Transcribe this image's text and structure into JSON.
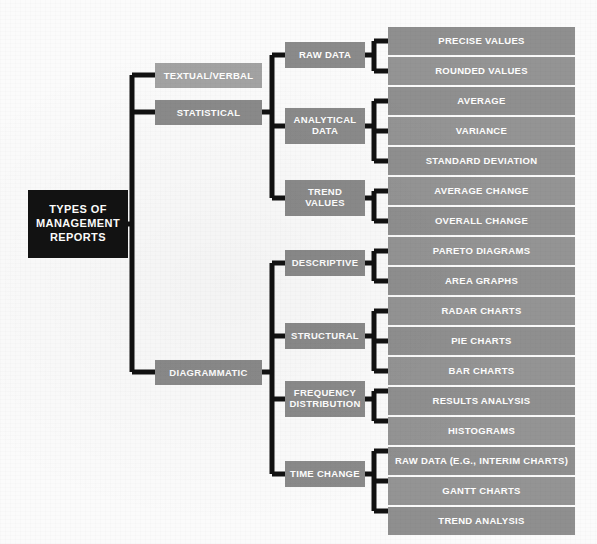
{
  "diagram": {
    "title": "Types of Management Reports",
    "root": {
      "label": "TYPES OF\nMANAGEMENT\nREPORTS",
      "line1": "TYPES OF",
      "line2": "MANAGEMENT",
      "line3": "REPORTS",
      "color": "#121212"
    },
    "colors": {
      "root_bg": "#121212",
      "level2_light_bg": "#a3a3a3",
      "level2_dark_bg": "#8a8a8a",
      "level3_bg": "#8a8a8a",
      "leaf_bg": "#8f8f8f",
      "connector": "#111111",
      "text": "#ffffff",
      "background": "#fbfbfb"
    },
    "level2": [
      {
        "label": "TEXTUAL/VERBAL",
        "shade": "light"
      },
      {
        "label": "STATISTICAL",
        "shade": "dark"
      },
      {
        "label": "DIAGRAMMATIC",
        "shade": "dark"
      }
    ],
    "level3": [
      {
        "line1": "RAW DATA",
        "line2": "",
        "parent": "STATISTICAL"
      },
      {
        "line1": "ANALYTICAL",
        "line2": "DATA",
        "parent": "STATISTICAL"
      },
      {
        "line1": "TREND",
        "line2": "VALUES",
        "parent": "STATISTICAL"
      },
      {
        "line1": "DESCRIPTIVE",
        "line2": "",
        "parent": "DIAGRAMMATIC"
      },
      {
        "line1": "STRUCTURAL",
        "line2": "",
        "parent": "DIAGRAMMATIC"
      },
      {
        "line1": "FREQUENCY",
        "line2": "DISTRIBUTION",
        "parent": "DIAGRAMMATIC"
      },
      {
        "line1": "TIME CHANGE",
        "line2": "",
        "parent": "DIAGRAMMATIC"
      }
    ],
    "leaves": [
      {
        "label": "PRECISE VALUES",
        "parent": "RAW DATA"
      },
      {
        "label": "ROUNDED VALUES",
        "parent": "RAW DATA"
      },
      {
        "label": "AVERAGE",
        "parent": "ANALYTICAL DATA"
      },
      {
        "label": "VARIANCE",
        "parent": "ANALYTICAL DATA"
      },
      {
        "label": "STANDARD DEVIATION",
        "parent": "ANALYTICAL DATA"
      },
      {
        "label": "AVERAGE CHANGE",
        "parent": "TREND VALUES"
      },
      {
        "label": "OVERALL CHANGE",
        "parent": "TREND VALUES"
      },
      {
        "label": "PARETO DIAGRAMS",
        "parent": "DESCRIPTIVE"
      },
      {
        "label": "AREA GRAPHS",
        "parent": "DESCRIPTIVE"
      },
      {
        "label": "RADAR CHARTS",
        "parent": "STRUCTURAL"
      },
      {
        "label": "PIE CHARTS",
        "parent": "STRUCTURAL"
      },
      {
        "label": "BAR CHARTS",
        "parent": "STRUCTURAL"
      },
      {
        "label": "RESULTS ANALYSIS",
        "parent": "FREQUENCY DISTRIBUTION"
      },
      {
        "label": "HISTOGRAMS",
        "parent": "FREQUENCY DISTRIBUTION"
      },
      {
        "label": "RAW DATA (E.G., INTERIM CHARTS)",
        "parent": "TIME CHANGE"
      },
      {
        "label": "GANTT CHARTS",
        "parent": "TIME CHANGE"
      },
      {
        "label": "TREND ANALYSIS",
        "parent": "TIME CHANGE"
      }
    ]
  }
}
